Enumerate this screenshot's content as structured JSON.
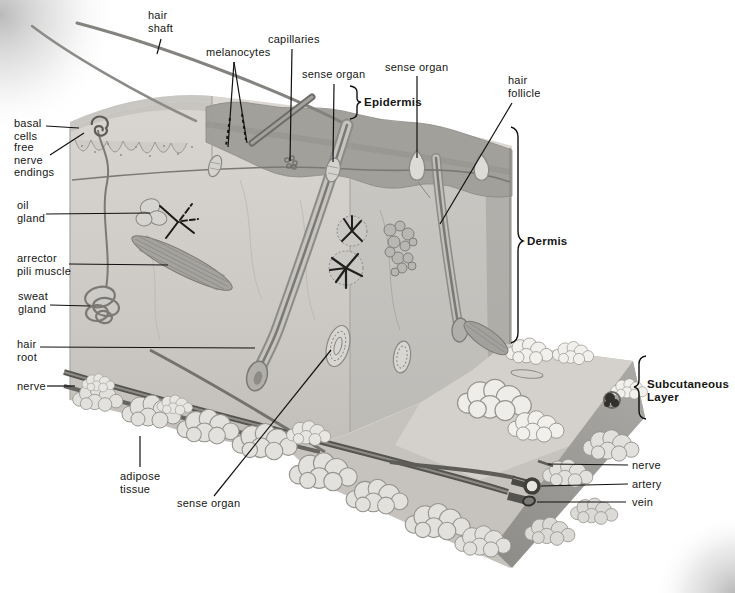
{
  "figure": {
    "type": "anatomical-diagram",
    "labels": {
      "hair_shaft": "hair\nshaft",
      "melanocytes": "melanocytes",
      "capillaries": "capillaries",
      "sense_organ_top_left": "sense organ",
      "sense_organ_top_right": "sense organ",
      "epidermis": "Epidermis",
      "hair_follicle": "hair\nfollicle",
      "basal_cells": "basal\ncells",
      "free_nerve_endings": "free\nnerve\nendings",
      "oil_gland": "oil\ngland",
      "arrector_pili_muscle": "arrector\npili muscle",
      "sweat_gland": "sweat\ngland",
      "hair_root": "hair\nroot",
      "nerve_left": "nerve",
      "adipose_tissue": "adipose\ntissue",
      "sense_organ_bottom": "sense organ",
      "dermis": "Dermis",
      "subcutaneous_layer": "Subcutaneous\nLayer",
      "nerve_right": "nerve",
      "artery": "artery",
      "vein": "vein"
    },
    "palette": {
      "ink": "#161614",
      "tissue_light": "#d6d3cf",
      "tissue_mid": "#c7c4c0",
      "epidermis_band": "#a2a09b",
      "adipose": "#e3e1dd",
      "adipose_highlight": "#f2f0ec",
      "deep_line": "#56544f",
      "corner_shadow": "#a8a8a8"
    }
  }
}
